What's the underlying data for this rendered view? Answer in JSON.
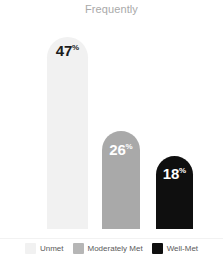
{
  "chart_data": {
    "type": "bar",
    "title": "Frequently",
    "xlabel": "",
    "ylabel": "",
    "ylim": [
      0,
      50
    ],
    "grid": false,
    "legend_position": "bottom",
    "categories": [
      "Unmet",
      "Moderately Met",
      "Well-Met"
    ],
    "values": [
      47,
      26,
      18
    ],
    "value_suffix": "%",
    "bars": [
      {
        "category": "Unmet",
        "value": 47,
        "value_number": "47",
        "value_suffix": "%",
        "color": "#f1f1f1",
        "label_color": "#1c1c1c"
      },
      {
        "category": "Moderately Met",
        "value": 26,
        "value_number": "26",
        "value_suffix": "%",
        "color": "#a9a9a9",
        "label_color": "#ffffff"
      },
      {
        "category": "Well-Met",
        "value": 18,
        "value_number": "18",
        "value_suffix": "%",
        "color": "#0f0f0f",
        "label_color": "#ffffff"
      }
    ],
    "legend": [
      {
        "label": "Unmet",
        "color": "#f1f1f1"
      },
      {
        "label": "Moderately Met",
        "color": "#b6b6b6"
      },
      {
        "label": "Well-Met",
        "color": "#0f0f0f"
      }
    ]
  },
  "title_color": "#a9a9a9"
}
